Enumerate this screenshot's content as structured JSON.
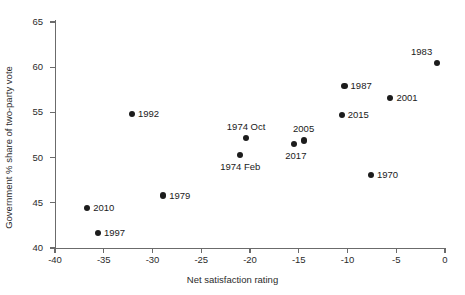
{
  "chart_data": {
    "type": "scatter",
    "title": "",
    "xlabel": "Net satisfaction rating",
    "ylabel": "Government % share of two-party vote",
    "xlim": [
      -40,
      0
    ],
    "ylim": [
      40,
      65
    ],
    "xticks": [
      -40,
      -35,
      -30,
      -25,
      -20,
      -15,
      -10,
      -5,
      0
    ],
    "xtick_labels": [
      "-40",
      "-35",
      "-30",
      "-25",
      "-20",
      "-15",
      "-10",
      "-5",
      "0"
    ],
    "yticks": [
      40,
      45,
      50,
      55,
      60,
      65
    ],
    "ytick_labels": [
      "40",
      "45",
      "50",
      "55",
      "60",
      "65"
    ],
    "grid": false,
    "legend": "none",
    "marker_color": "#1c1c1c",
    "axis_color": "#6b6b6b",
    "points": [
      {
        "label": "2010",
        "x": -36.7,
        "y": 44.4,
        "label_pos": "right"
      },
      {
        "label": "1997",
        "x": -35.6,
        "y": 41.7,
        "label_pos": "right"
      },
      {
        "label": "1992",
        "x": -32.1,
        "y": 54.8,
        "label_pos": "right"
      },
      {
        "label": "1979",
        "x": -28.9,
        "y": 45.8,
        "label_pos": "right"
      },
      {
        "label": "1974 Feb",
        "x": -21.0,
        "y": 50.3,
        "label_pos": "below"
      },
      {
        "label": "1974 Oct",
        "x": -20.4,
        "y": 52.2,
        "label_pos": "above"
      },
      {
        "label": "2017",
        "x": -15.5,
        "y": 51.5,
        "label_pos": "below-left"
      },
      {
        "label": "2005",
        "x": -14.5,
        "y": 51.9,
        "label_pos": "above"
      },
      {
        "label": "2015",
        "x": -10.6,
        "y": 54.7,
        "label_pos": "right"
      },
      {
        "label": "1987",
        "x": -10.3,
        "y": 57.9,
        "label_pos": "right"
      },
      {
        "label": "1970",
        "x": -7.6,
        "y": 48.1,
        "label_pos": "right"
      },
      {
        "label": "2001",
        "x": -5.6,
        "y": 56.6,
        "label_pos": "right"
      },
      {
        "label": "1983",
        "x": -0.8,
        "y": 60.5,
        "label_pos": "above-left"
      }
    ]
  }
}
